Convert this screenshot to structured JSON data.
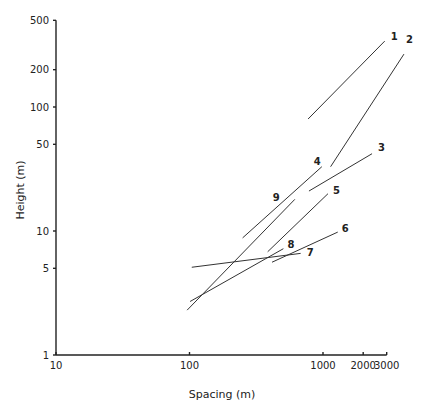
{
  "chart_data": {
    "type": "line",
    "title": "",
    "xlabel": "Spacing (m)",
    "ylabel": "Height (m)",
    "xscale": "log",
    "yscale": "log",
    "xlim": [
      10,
      3000
    ],
    "ylim": [
      1,
      500
    ],
    "grid": false,
    "legend": "none",
    "x_ticks": [
      {
        "value": 10,
        "label": "10"
      },
      {
        "value": 100,
        "label": "100"
      },
      {
        "value": 1000,
        "label": "1000"
      },
      {
        "value": 2000,
        "label": "2000"
      },
      {
        "value": 3000,
        "label": "3000"
      }
    ],
    "y_ticks": [
      {
        "value": 1,
        "label": "1"
      },
      {
        "value": 5,
        "label": "5"
      },
      {
        "value": 10,
        "label": "10"
      },
      {
        "value": 50,
        "label": "50"
      },
      {
        "value": 100,
        "label": "100"
      },
      {
        "value": 200,
        "label": "200"
      },
      {
        "value": 500,
        "label": "500"
      }
    ],
    "series": [
      {
        "name": "1",
        "points": [
          [
            773,
            80
          ],
          [
            2900,
            340
          ]
        ]
      },
      {
        "name": "2",
        "points": [
          [
            1140,
            33
          ],
          [
            4040,
            267
          ]
        ]
      },
      {
        "name": "3",
        "points": [
          [
            785,
            21
          ],
          [
            2330,
            42
          ]
        ]
      },
      {
        "name": "4",
        "points": [
          [
            250,
            8.8
          ],
          [
            980,
            33
          ]
        ]
      },
      {
        "name": "5",
        "points": [
          [
            385,
            6.8
          ],
          [
            1090,
            20
          ]
        ]
      },
      {
        "name": "6",
        "points": [
          [
            415,
            5.6
          ],
          [
            1290,
            9.8
          ]
        ]
      },
      {
        "name": "7",
        "points": [
          [
            104,
            5.1
          ],
          [
            680,
            6.6
          ]
        ]
      },
      {
        "name": "8",
        "points": [
          [
            101,
            2.7
          ],
          [
            505,
            7.2
          ]
        ]
      },
      {
        "name": "9",
        "points": [
          [
            96,
            2.3
          ],
          [
            615,
            18
          ]
        ]
      }
    ]
  }
}
